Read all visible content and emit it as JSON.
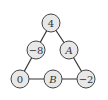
{
  "diagram": {
    "type": "number-triangle",
    "nodes": [
      {
        "id": "top",
        "label": "4",
        "x": 51,
        "y": 23,
        "variable": false
      },
      {
        "id": "mid-left",
        "label": "−8",
        "x": 36,
        "y": 50,
        "variable": false
      },
      {
        "id": "mid-right",
        "label": "A",
        "x": 69,
        "y": 50,
        "variable": true
      },
      {
        "id": "bottom-left",
        "label": "0",
        "x": 20,
        "y": 79,
        "variable": false
      },
      {
        "id": "bottom-middle",
        "label": "B",
        "x": 53,
        "y": 79,
        "variable": true
      },
      {
        "id": "bottom-right",
        "label": "−2",
        "x": 86,
        "y": 79,
        "variable": false
      }
    ],
    "edges": [
      [
        "top",
        "mid-left"
      ],
      [
        "top",
        "mid-right"
      ],
      [
        "mid-left",
        "bottom-left"
      ],
      [
        "mid-right",
        "bottom-right"
      ],
      [
        "bottom-left",
        "bottom-middle"
      ],
      [
        "bottom-middle",
        "bottom-right"
      ]
    ],
    "node_radius": 9,
    "colors": {
      "node_fill": "#e8e8e8",
      "stroke": "#444444",
      "text": "#333333"
    }
  }
}
